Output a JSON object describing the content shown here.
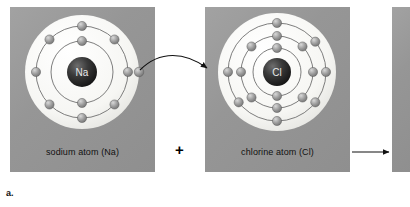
{
  "figure": {
    "label": "a.",
    "caption_plus": "+"
  },
  "panels": [
    {
      "id": "sodium",
      "label": "sodium atom (Na)",
      "nucleus_symbol": "Na",
      "shell_counts": [
        2,
        8,
        1
      ],
      "x": 10,
      "y": 7,
      "w": 145,
      "h": 165
    },
    {
      "id": "chlorine",
      "label": "chlorine atom (Cl)",
      "nucleus_symbol": "Cl",
      "shell_counts": [
        2,
        8,
        7
      ],
      "x": 205,
      "y": 7,
      "w": 145,
      "h": 165
    },
    {
      "id": "product",
      "label": "",
      "nucleus_symbol": "",
      "shell_counts": [],
      "x": 392,
      "y": 7,
      "w": 18,
      "h": 165
    }
  ],
  "arrows": {
    "electron_transfer": "curved-arrow-na-to-cl",
    "reaction": "straight-arrow-right"
  },
  "colors": {
    "panel_gray": "#9a9a9a",
    "shell_white": "#f7f7f5",
    "electron": "#8c8c8c",
    "electron_highlight": "#cfcfcf",
    "nucleus": "#2b2b2b",
    "orbit_line": "#6b6b6b",
    "ink": "#111111",
    "background": "#ffffff"
  }
}
